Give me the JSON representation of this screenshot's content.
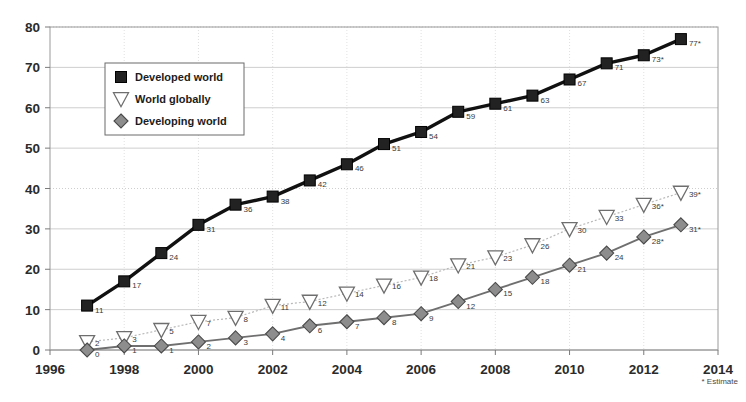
{
  "chart_data": {
    "type": "line",
    "title": "",
    "xlabel": "",
    "ylabel": "",
    "x": [
      1997,
      1998,
      1999,
      2000,
      2001,
      2002,
      2003,
      2004,
      2005,
      2006,
      2007,
      2008,
      2009,
      2010,
      2011,
      2012,
      2013
    ],
    "xlim": [
      1996,
      2014
    ],
    "ylim": [
      0,
      80
    ],
    "xticks": [
      "1996",
      "1998",
      "2000",
      "2002",
      "2004",
      "2006",
      "2008",
      "2010",
      "2012",
      "2014"
    ],
    "xtick_values": [
      1996,
      1998,
      2000,
      2002,
      2004,
      2006,
      2008,
      2010,
      2012,
      2014
    ],
    "yticks": [
      "0",
      "10",
      "20",
      "30",
      "40",
      "50",
      "60",
      "70",
      "80"
    ],
    "ytick_values": [
      0,
      10,
      20,
      30,
      40,
      50,
      60,
      70,
      80
    ],
    "grid": true,
    "legend_position": "upper-left-inside",
    "footnote": "* Estimate",
    "series": [
      {
        "name": "Developed world",
        "marker": "square",
        "color": "#1a1a1a",
        "line_color": "#111111",
        "values": [
          11,
          17,
          24,
          31,
          36,
          38,
          42,
          46,
          51,
          54,
          59,
          61,
          63,
          67,
          71,
          73,
          77
        ],
        "point_labels": [
          "11",
          "17",
          "24",
          "31",
          "36",
          "38",
          "42",
          "46",
          "51",
          "54",
          "59",
          "61",
          "63",
          "67",
          "71",
          "73*",
          "77*"
        ]
      },
      {
        "name": "World globally",
        "marker": "triangle-down-open",
        "color": "#ffffff",
        "line_color": "#b9b9b9",
        "values": [
          2,
          3,
          5,
          7,
          8,
          11,
          12,
          14,
          16,
          18,
          21,
          23,
          26,
          30,
          33,
          36,
          39
        ],
        "point_labels": [
          "2",
          "3",
          "5",
          "7",
          "8",
          "11",
          "12",
          "14",
          "16",
          "18",
          "21",
          "23",
          "26",
          "30",
          "33",
          "36*",
          "39*"
        ]
      },
      {
        "name": "Developing world",
        "marker": "diamond",
        "color": "#8a8a8a",
        "line_color": "#6f6f6f",
        "values": [
          0,
          1,
          1,
          2,
          3,
          4,
          6,
          7,
          8,
          9,
          12,
          15,
          18,
          21,
          24,
          28,
          31
        ],
        "point_labels": [
          "0",
          "1",
          "1",
          "2",
          "3",
          "4",
          "6",
          "7",
          "8",
          "9",
          "12",
          "15",
          "18",
          "21",
          "24",
          "28*",
          "31*"
        ]
      }
    ]
  },
  "legend": {
    "items": [
      {
        "label": "Developed world",
        "marker": "square"
      },
      {
        "label": "World globally",
        "marker": "triangle-down-open"
      },
      {
        "label": "Developing world",
        "marker": "diamond"
      }
    ]
  },
  "colors": {
    "developed": "#1a1a1a",
    "global_line": "#b9b9b9",
    "developing": "#8a8a8a",
    "grid": "#c8c8c8",
    "axis": "#9a9a9a",
    "background": "#ffffff"
  }
}
